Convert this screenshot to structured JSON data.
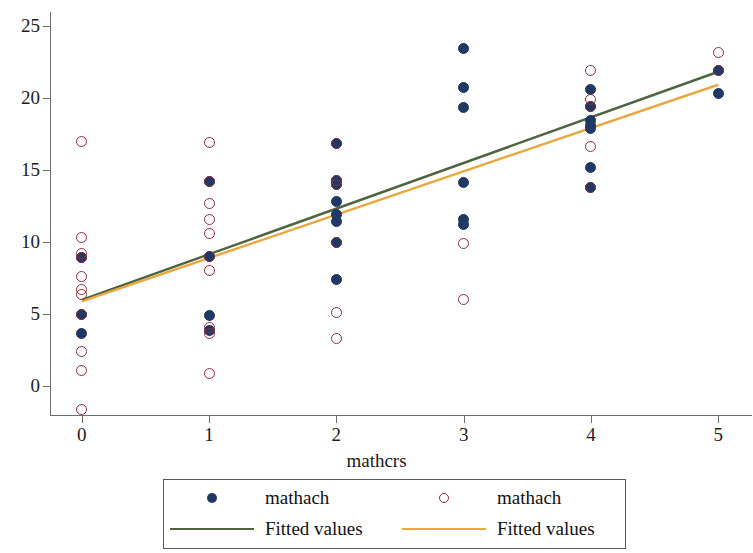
{
  "chart_data": {
    "type": "scatter",
    "title": "",
    "subtitle": "",
    "xlabel": "mathcrs",
    "ylabel": "",
    "xlim": [
      -0.25,
      5.25
    ],
    "ylim": [
      -2.6,
      25.8
    ],
    "xticks": [
      0,
      1,
      2,
      3,
      4,
      5
    ],
    "xtick_labels": [
      "0",
      "1",
      "2",
      "3",
      "4",
      "5"
    ],
    "yticks": [
      0,
      5,
      10,
      15,
      20,
      25
    ],
    "ytick_labels": [
      "0",
      "5",
      "10",
      "15",
      "20",
      "25"
    ],
    "grid": false,
    "legend_position": "below-center",
    "colors": {
      "series1_marker": "#1f3864",
      "series2_marker": "#8c2f39",
      "fit1_line": "#4e6340",
      "fit2_line": "#e9a83f",
      "axis": "#6d6c70",
      "text": "#1b1b1b",
      "legend_border": "#585858",
      "background": "#ffffff"
    },
    "series": [
      {
        "name": "mathach",
        "marker": "filled-circle",
        "color": "#1f3864",
        "points": [
          [
            0,
            8.9
          ],
          [
            0,
            5.0
          ],
          [
            0,
            3.7
          ],
          [
            1,
            14.2
          ],
          [
            1,
            9.0
          ],
          [
            1,
            4.9
          ],
          [
            1,
            3.9
          ],
          [
            2,
            16.8
          ],
          [
            2,
            14.3
          ],
          [
            2,
            14.0
          ],
          [
            2,
            12.8
          ],
          [
            2,
            11.9
          ],
          [
            2,
            11.4
          ],
          [
            2,
            10.0
          ],
          [
            2,
            7.4
          ],
          [
            3,
            23.4
          ],
          [
            3,
            20.7
          ],
          [
            3,
            19.3
          ],
          [
            3,
            14.1
          ],
          [
            3,
            11.6
          ],
          [
            3,
            11.2
          ],
          [
            4,
            20.6
          ],
          [
            4,
            19.4
          ],
          [
            4,
            18.4
          ],
          [
            4,
            18.1
          ],
          [
            4,
            17.9
          ],
          [
            4,
            15.2
          ],
          [
            4,
            13.8
          ],
          [
            5,
            21.9
          ],
          [
            5,
            20.3
          ]
        ]
      },
      {
        "name": "mathach",
        "marker": "open-circle",
        "color": "#8c2f39",
        "points": [
          [
            0,
            17.0
          ],
          [
            0,
            10.3
          ],
          [
            0,
            9.2
          ],
          [
            0,
            8.9
          ],
          [
            0,
            7.6
          ],
          [
            0,
            6.7
          ],
          [
            0,
            6.4
          ],
          [
            0,
            5.0
          ],
          [
            0,
            2.4
          ],
          [
            0,
            1.1
          ],
          [
            0,
            -1.6
          ],
          [
            1,
            16.9
          ],
          [
            1,
            14.2
          ],
          [
            1,
            12.7
          ],
          [
            1,
            11.6
          ],
          [
            1,
            10.6
          ],
          [
            1,
            9.0
          ],
          [
            1,
            8.0
          ],
          [
            1,
            4.1
          ],
          [
            1,
            3.7
          ],
          [
            1,
            0.9
          ],
          [
            2,
            16.8
          ],
          [
            2,
            14.3
          ],
          [
            2,
            14.0
          ],
          [
            2,
            10.0
          ],
          [
            2,
            5.1
          ],
          [
            2,
            3.3
          ],
          [
            3,
            9.9
          ],
          [
            3,
            6.0
          ],
          [
            4,
            21.9
          ],
          [
            4,
            19.9
          ],
          [
            4,
            19.4
          ],
          [
            4,
            16.6
          ],
          [
            4,
            13.8
          ],
          [
            5,
            23.1
          ],
          [
            5,
            21.9
          ]
        ]
      }
    ],
    "fits": [
      {
        "name": "Fitted values",
        "color": "#4e6340",
        "x": [
          0,
          5
        ],
        "y": [
          6.0,
          21.8
        ]
      },
      {
        "name": "Fitted values",
        "color": "#e9a83f",
        "x": [
          0,
          5
        ],
        "y": [
          5.9,
          20.9
        ]
      }
    ]
  },
  "legend": {
    "entries": [
      {
        "label": "mathach",
        "key": "filled-circle-key",
        "color": "#1f3864"
      },
      {
        "label": "mathach",
        "key": "open-circle-key",
        "color": "#8c2f39"
      },
      {
        "label": "Fitted values",
        "key": "line-key",
        "color": "#4e6340"
      },
      {
        "label": "Fitted values",
        "key": "line-key",
        "color": "#e9a83f"
      }
    ]
  }
}
